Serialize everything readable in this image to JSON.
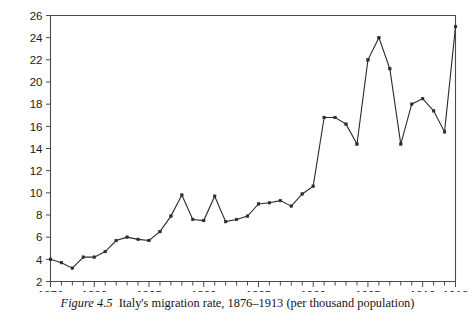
{
  "caption": {
    "figure_number": "Figure 4.5",
    "text": "Italy's migration rate, 1876–1913 (per thousand population)"
  },
  "chart_data": {
    "type": "line",
    "title": "",
    "subtitle": "",
    "xlabel": "",
    "ylabel": "",
    "xlim": [
      1876,
      1913
    ],
    "ylim": [
      2,
      26
    ],
    "grid": false,
    "legend": null,
    "legend_position": "none",
    "marker": "square",
    "line_color": "#2b2b2b",
    "marker_color": "#2b2b2b",
    "x_tick_labels": [
      "1876",
      "1880",
      "1885",
      "1890",
      "1895",
      "1900",
      "1905",
      "1910",
      "1913"
    ],
    "x_tick_values": [
      1876,
      1880,
      1885,
      1890,
      1895,
      1900,
      1905,
      1910,
      1913
    ],
    "x_minor_ticks_every": 1,
    "y_tick_labels": [
      "2",
      "4",
      "6",
      "8",
      "10",
      "12",
      "14",
      "16",
      "18",
      "20",
      "22",
      "24",
      "26"
    ],
    "y_tick_values": [
      2,
      4,
      6,
      8,
      10,
      12,
      14,
      16,
      18,
      20,
      22,
      24,
      26
    ],
    "x": [
      1876,
      1877,
      1878,
      1879,
      1880,
      1881,
      1882,
      1883,
      1884,
      1885,
      1886,
      1887,
      1888,
      1889,
      1890,
      1891,
      1892,
      1893,
      1894,
      1895,
      1896,
      1897,
      1898,
      1899,
      1900,
      1901,
      1902,
      1903,
      1904,
      1905,
      1906,
      1907,
      1908,
      1909,
      1910,
      1911,
      1912,
      1913
    ],
    "values": [
      4.0,
      3.7,
      3.2,
      4.2,
      4.2,
      4.7,
      5.7,
      6.0,
      5.8,
      5.7,
      6.5,
      7.9,
      9.8,
      7.6,
      7.5,
      9.7,
      7.4,
      7.6,
      7.9,
      9.0,
      9.1,
      9.3,
      8.8,
      9.9,
      10.6,
      16.8,
      16.8,
      16.2,
      14.4,
      22.0,
      24.0,
      21.2,
      14.4,
      18.0,
      18.5,
      17.4,
      15.5,
      25.0
    ],
    "series": [
      {
        "name": "Italy's migration rate",
        "values": [
          4.0,
          3.7,
          3.2,
          4.2,
          4.2,
          4.7,
          5.7,
          6.0,
          5.8,
          5.7,
          6.5,
          7.9,
          9.8,
          7.6,
          7.5,
          9.7,
          7.4,
          7.6,
          7.9,
          9.0,
          9.1,
          9.3,
          8.8,
          9.9,
          10.6,
          16.8,
          16.8,
          16.2,
          14.4,
          22.0,
          24.0,
          21.2,
          14.4,
          18.0,
          18.5,
          17.4,
          15.5,
          25.0
        ]
      }
    ]
  }
}
